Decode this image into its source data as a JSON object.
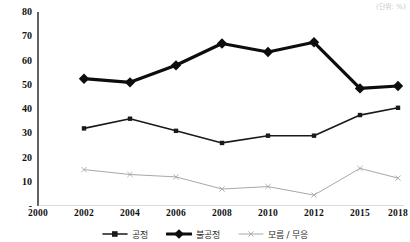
{
  "unit_note": "(단위: %)",
  "axes": {
    "y_ticks": [
      "80",
      "70",
      "60",
      "50",
      "40",
      "30",
      "20",
      "10",
      "-"
    ],
    "x_ticks": [
      "2000",
      "2002",
      "2004",
      "2006",
      "2008",
      "2010",
      "2012",
      "2015",
      "2018"
    ]
  },
  "legend": {
    "items": [
      {
        "label": "공정",
        "marker": "square-marker-icon",
        "color": "#1a1a1a"
      },
      {
        "label": "불공정",
        "marker": "diamond-marker-icon",
        "color": "#0d0d0d"
      },
      {
        "label": "모름 / 무응",
        "marker": "cross-marker-icon",
        "color": "#a8a8a8"
      }
    ]
  },
  "chart_data": {
    "type": "line",
    "title": "",
    "xlabel": "",
    "ylabel": "",
    "unit": "%",
    "grid": false,
    "legend_position": "bottom",
    "categories": [
      "2000",
      "2002",
      "2004",
      "2006",
      "2008",
      "2010",
      "2012",
      "2015",
      "2018"
    ],
    "x": [
      2000,
      2002,
      2004,
      2006,
      2008,
      2010,
      2012,
      2015,
      2018
    ],
    "ylim": [
      0,
      80
    ],
    "ytick_values": [
      0,
      10,
      20,
      30,
      40,
      50,
      60,
      70,
      80
    ],
    "series": [
      {
        "name": "공정",
        "color": "#1a1a1a",
        "marker": "square",
        "line_width": 1.6,
        "x": [
          2002,
          2004,
          2006,
          2008,
          2010,
          2012,
          2015,
          2018
        ],
        "values": [
          32,
          36,
          31,
          26,
          29,
          29,
          37.5,
          40.5
        ]
      },
      {
        "name": "불공정",
        "color": "#0d0d0d",
        "marker": "diamond",
        "line_width": 3.2,
        "x": [
          2002,
          2004,
          2006,
          2008,
          2010,
          2012,
          2015,
          2018
        ],
        "values": [
          52.5,
          51,
          58,
          67,
          63.5,
          67.5,
          48.5,
          49.5
        ]
      },
      {
        "name": "모름 / 무응",
        "color": "#a8a8a8",
        "marker": "cross",
        "line_width": 1,
        "x": [
          2002,
          2004,
          2006,
          2008,
          2010,
          2012,
          2015,
          2018
        ],
        "values": [
          15,
          13,
          12,
          7,
          8,
          4.5,
          15.5,
          11.5
        ]
      }
    ]
  }
}
